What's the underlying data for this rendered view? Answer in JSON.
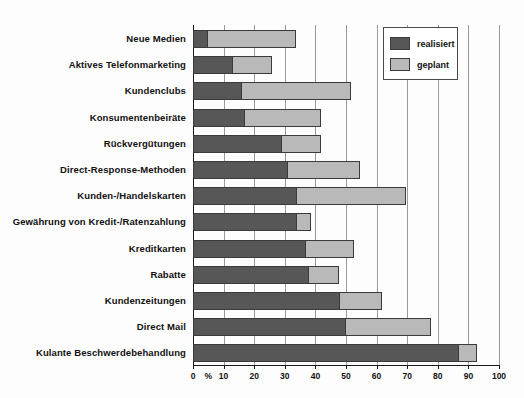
{
  "chart_data": {
    "type": "bar",
    "orientation": "horizontal",
    "stacked": true,
    "title": "",
    "xlabel": "%",
    "ylabel": "",
    "xlim": [
      0,
      100
    ],
    "xticks": [
      0,
      10,
      20,
      30,
      40,
      50,
      60,
      70,
      80,
      90,
      100
    ],
    "xtick_labels": [
      "0",
      "10",
      "20",
      "30",
      "40",
      "50",
      "60",
      "70",
      "80",
      "90",
      "100"
    ],
    "percent_marker": "%",
    "grid": true,
    "grid_axis": "x",
    "legend_position": "top-right",
    "categories": [
      "Neue Medien",
      "Aktives Telefonmarketing",
      "Kundenclubs",
      "Konsumentenbeiräte",
      "Rückvergütungen",
      "Direct-Response-Methoden",
      "Kunden-/Handelskarten",
      "Gewährung von Kredit-/Ratenzahlung",
      "Kreditkarten",
      "Rabatte",
      "Kundenzeitungen",
      "Direct Mail",
      "Kulante Beschwerdebehandlung"
    ],
    "series": [
      {
        "name": "realisiert",
        "color": "#575757",
        "values": [
          5,
          13,
          16,
          17,
          29,
          31,
          34,
          34,
          37,
          38,
          48,
          50,
          87
        ]
      },
      {
        "name": "geplant",
        "color": "#b9b9b9",
        "values": [
          29,
          13,
          36,
          25,
          13,
          24,
          36,
          5,
          16,
          10,
          14,
          28,
          6
        ]
      }
    ],
    "totals": [
      34,
      26,
      52,
      42,
      42,
      55,
      70,
      39,
      53,
      48,
      62,
      78,
      93
    ]
  },
  "legend": {
    "items": [
      {
        "label": "realisiert",
        "swatch": "dark-gray-swatch"
      },
      {
        "label": "geplant",
        "swatch": "light-gray-swatch"
      }
    ]
  }
}
